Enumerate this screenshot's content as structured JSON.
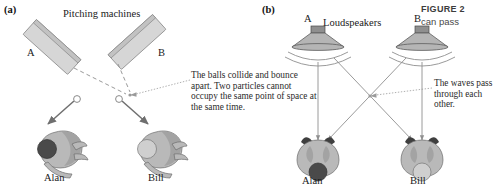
{
  "figure": {
    "number_label": "FIGURE 2",
    "caption_text": "can pass"
  },
  "panel_a": {
    "label": "(a)",
    "heading": "Pitching machines",
    "machines": [
      {
        "id": "A",
        "label": "A"
      },
      {
        "id": "B",
        "label": "B"
      }
    ],
    "annotation": "The balls collide and bounce apart. Two particles cannot occupy the same point of space at the same time.",
    "people": [
      {
        "label": "Alan"
      },
      {
        "label": "Bill"
      }
    ]
  },
  "panel_b": {
    "label": "(b)",
    "heading": "Loudspeakers",
    "speakers": [
      {
        "id": "A",
        "label": "A"
      },
      {
        "id": "B",
        "label": "B"
      }
    ],
    "annotation": "The waves pass through each other.",
    "people": [
      {
        "label": "Alan"
      },
      {
        "label": "Bill"
      }
    ]
  },
  "colors": {
    "background": "#ffffff",
    "text": "#1a1a1a",
    "machine_fill": "#d6d6d6",
    "arrow_gray": "#6f6f6f",
    "dash_gray": "#9a9a9a",
    "caption_gray": "#4a4a4a",
    "ball_dark": "#4a4a4a",
    "ball_light": "#cfcfcf"
  }
}
